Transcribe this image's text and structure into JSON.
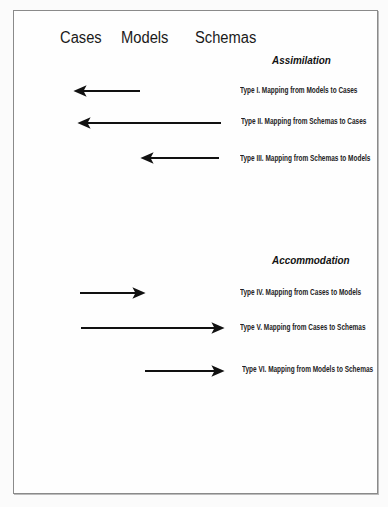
{
  "columns": [
    "Cases",
    "Models",
    "Schemas"
  ],
  "sections": {
    "assimilation": {
      "title": "Assimilation",
      "items": [
        {
          "label": "Type I.  Mapping from Models to Cases",
          "direction": "left",
          "from": "Models",
          "to": "Cases"
        },
        {
          "label": "Type II.  Mapping from Schemas to Cases",
          "direction": "left",
          "from": "Schemas",
          "to": "Cases"
        },
        {
          "label": "Type III. Mapping from Schemas to Models",
          "direction": "left",
          "from": "Schemas",
          "to": "Models"
        }
      ]
    },
    "accommodation": {
      "title": "Accommodation",
      "items": [
        {
          "label": "Type IV. Mapping from Cases to Models",
          "direction": "right",
          "from": "Cases",
          "to": "Models"
        },
        {
          "label": "Type V.  Mapping from Cases  to Schemas",
          "direction": "right",
          "from": "Cases",
          "to": "Schemas"
        },
        {
          "label": "Type VI.  Mapping from Models to Schemas",
          "direction": "right",
          "from": "Models",
          "to": "Schemas"
        }
      ]
    }
  },
  "caption": "",
  "colors": {
    "arrow": "#111111",
    "frame": "#8a8a8a"
  }
}
